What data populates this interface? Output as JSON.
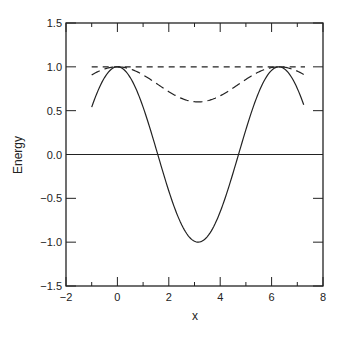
{
  "chart_data": {
    "type": "line",
    "title": "",
    "xlabel": "x",
    "ylabel": "Energy",
    "xlim": [
      -2,
      8
    ],
    "ylim": [
      -1.5,
      1.5
    ],
    "grid": false,
    "legend": null,
    "x_ticks": [
      -2,
      0,
      2,
      4,
      6,
      8
    ],
    "x_tick_labels": [
      "−2",
      "0",
      "2",
      "4",
      "6",
      "8"
    ],
    "x_minor_ticks": [
      -1,
      1,
      3,
      5,
      7
    ],
    "y_ticks": [
      -1.5,
      -1.0,
      -0.5,
      0.0,
      0.5,
      1.0,
      1.5
    ],
    "y_tick_labels": [
      "−1.5",
      "−1.0",
      "−0.5",
      "0.0",
      "0.5",
      "1.0",
      "1.5"
    ],
    "series": [
      {
        "name": "solid curve",
        "style": "solid",
        "x": [
          -1.0,
          -0.5,
          0.0,
          0.5,
          1.0,
          1.5,
          2.0,
          2.5,
          3.0,
          3.14,
          3.5,
          4.0,
          4.5,
          5.0,
          5.5,
          6.0,
          6.28,
          6.5,
          7.0,
          7.28
        ],
        "y": [
          0.54,
          0.88,
          1.0,
          0.88,
          0.54,
          0.07,
          -0.42,
          -0.8,
          -0.99,
          -1.0,
          -0.94,
          -0.65,
          -0.21,
          0.28,
          0.71,
          0.96,
          1.0,
          0.98,
          0.75,
          0.58
        ]
      },
      {
        "name": "long-dashed curve",
        "style": "long-dash",
        "x": [
          -1.0,
          -0.5,
          0.0,
          0.5,
          1.0,
          1.5,
          2.0,
          2.5,
          3.0,
          3.14,
          3.5,
          4.0,
          4.5,
          5.0,
          5.5,
          6.0,
          6.28,
          6.5,
          7.0,
          7.28
        ],
        "y": [
          0.91,
          0.98,
          1.0,
          0.98,
          0.91,
          0.81,
          0.72,
          0.64,
          0.6,
          0.6,
          0.61,
          0.67,
          0.76,
          0.86,
          0.94,
          0.99,
          1.0,
          1.0,
          0.95,
          0.92
        ]
      },
      {
        "name": "short-dashed line",
        "style": "short-dash",
        "x": [
          -1.0,
          7.3
        ],
        "y": [
          1.0,
          1.0
        ]
      },
      {
        "name": "zero line",
        "style": "solid",
        "x": [
          -2,
          8
        ],
        "y": [
          0.0,
          0.0
        ]
      }
    ]
  }
}
